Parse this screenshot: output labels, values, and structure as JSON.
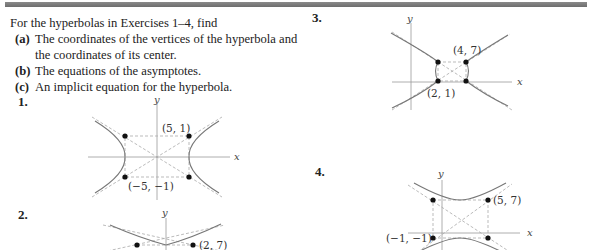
{
  "intro": {
    "lead": "For the hyperbolas in Exercises 1–4, find",
    "parts": [
      {
        "label": "(a)",
        "text": "The coordinates of the vertices of the hyperbola and the coordinates of its center."
      },
      {
        "label": "(b)",
        "text": "The equations of the asymptotes."
      },
      {
        "label": "(c)",
        "text": "An implicit equation for the hyperbola."
      }
    ]
  },
  "exercises": [
    {
      "number": "1.",
      "x_label": "x",
      "y_label": "y",
      "points": [
        "(5, 1)",
        "(−5, −1)"
      ]
    },
    {
      "number": "2.",
      "x_label": "x",
      "y_label": "y",
      "points": [
        "(2, 7)"
      ]
    },
    {
      "number": "3.",
      "x_label": "x",
      "y_label": "y",
      "points": [
        "(4, 7)",
        "(2, 1)"
      ]
    },
    {
      "number": "4.",
      "x_label": "x",
      "y_label": "y",
      "points": [
        "(5, 7)",
        "(−1, −1)"
      ]
    }
  ]
}
